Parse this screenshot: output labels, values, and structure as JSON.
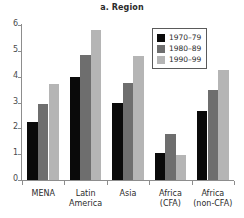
{
  "chart_data": {
    "type": "bar",
    "title": "a. Region",
    "xlabel": "",
    "ylabel": "",
    "ylim": [
      0,
      6
    ],
    "yticks": [
      0,
      1,
      2,
      3,
      4,
      5,
      6
    ],
    "grid": false,
    "legend_position": "top-right",
    "categories": [
      "MENA",
      "Latin America",
      "Asia",
      "Africa (CFA)",
      "Africa (non-CFA)"
    ],
    "category_lines": [
      [
        "MENA"
      ],
      [
        "Latin",
        "America"
      ],
      [
        "Asia"
      ],
      [
        "Africa",
        "(CFA)"
      ],
      [
        "Africa",
        "(non-CFA)"
      ]
    ],
    "series": [
      {
        "name": "1970–79",
        "color": "#0a0a0a",
        "values": [
          2.25,
          4.0,
          3.0,
          1.03,
          2.68
        ]
      },
      {
        "name": "1980–89",
        "color": "#6e6e6e",
        "values": [
          2.95,
          4.85,
          3.75,
          1.78,
          3.48
        ]
      },
      {
        "name": "1990–99",
        "color": "#b5b5b5",
        "values": [
          3.7,
          5.8,
          4.8,
          0.95,
          4.25
        ]
      }
    ]
  },
  "legend": {
    "items": [
      {
        "label": "1970–79"
      },
      {
        "label": "1980–89"
      },
      {
        "label": "1990–99"
      }
    ]
  },
  "axis": {
    "y_tick_labels": [
      "0",
      "1",
      "2",
      "3",
      "4",
      "5",
      "6"
    ]
  }
}
